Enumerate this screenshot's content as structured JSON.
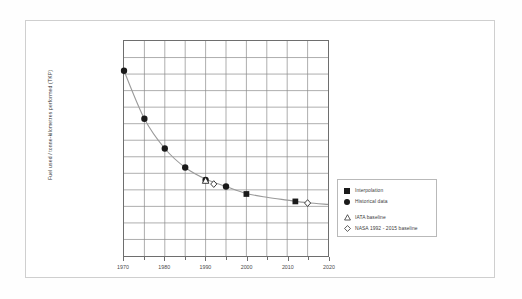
{
  "figure": {
    "ylabel": "Fuel used / tonne-kilometres performed (TKP)",
    "frame_color": "#cfcfcf",
    "grid_color": "#8a8a8a",
    "line_color": "#9a9a9a",
    "marker_color": "#1a1a1a"
  },
  "legend": {
    "entries": [
      {
        "label": "Interpolation",
        "marker": "filled-square-icon"
      },
      {
        "label": "Historical data",
        "marker": "filled-circle-icon"
      },
      {
        "label": "IATA baseline",
        "marker": "open-triangle-icon"
      },
      {
        "label": "NASA 1992 - 2015 baseline",
        "marker": "open-diamond-icon"
      }
    ]
  },
  "xaxis": {
    "ticks": [
      "1970",
      "1980",
      "1990",
      "2000",
      "2010",
      "2020"
    ]
  },
  "chart_data": {
    "type": "line",
    "title": "",
    "xlabel": "",
    "ylabel": "Fuel used / tonne-kilometres performed (TKP)",
    "xlim": [
      1970,
      2020
    ],
    "ylim": [
      0,
      13
    ],
    "grid": true,
    "grid_columns": 10,
    "grid_rows": 13,
    "xtick_labels": [
      "1970",
      "1980",
      "1990",
      "2000",
      "2010",
      "2020"
    ],
    "xtick_minor_step": 5,
    "ytick_labels": [],
    "legend_position": "right",
    "series": [
      {
        "name": "Historical data",
        "marker": "filled-circle",
        "x": [
          1970,
          1975,
          1980,
          1985,
          1990,
          1995
        ],
        "y": [
          11.2,
          8.3,
          6.5,
          5.35,
          4.6,
          4.2
        ]
      },
      {
        "name": "Interpolation",
        "marker": "filled-square",
        "x": [
          2000,
          2012
        ],
        "y": [
          3.75,
          3.3
        ]
      },
      {
        "name": "IATA baseline",
        "marker": "open-triangle",
        "x": [
          1990
        ],
        "y": [
          4.55
        ]
      },
      {
        "name": "NASA 1992 - 2015 baseline",
        "marker": "open-diamond",
        "x": [
          1992,
          2015
        ],
        "y": [
          4.35,
          3.2
        ]
      }
    ],
    "trend_curve": {
      "name": "Fitted decay curve",
      "x": [
        1970,
        1975,
        1980,
        1985,
        1990,
        1995,
        2000,
        2005,
        2010,
        2015,
        2020
      ],
      "y": [
        11.2,
        8.3,
        6.5,
        5.35,
        4.65,
        4.2,
        3.78,
        3.55,
        3.38,
        3.22,
        3.12
      ]
    }
  }
}
